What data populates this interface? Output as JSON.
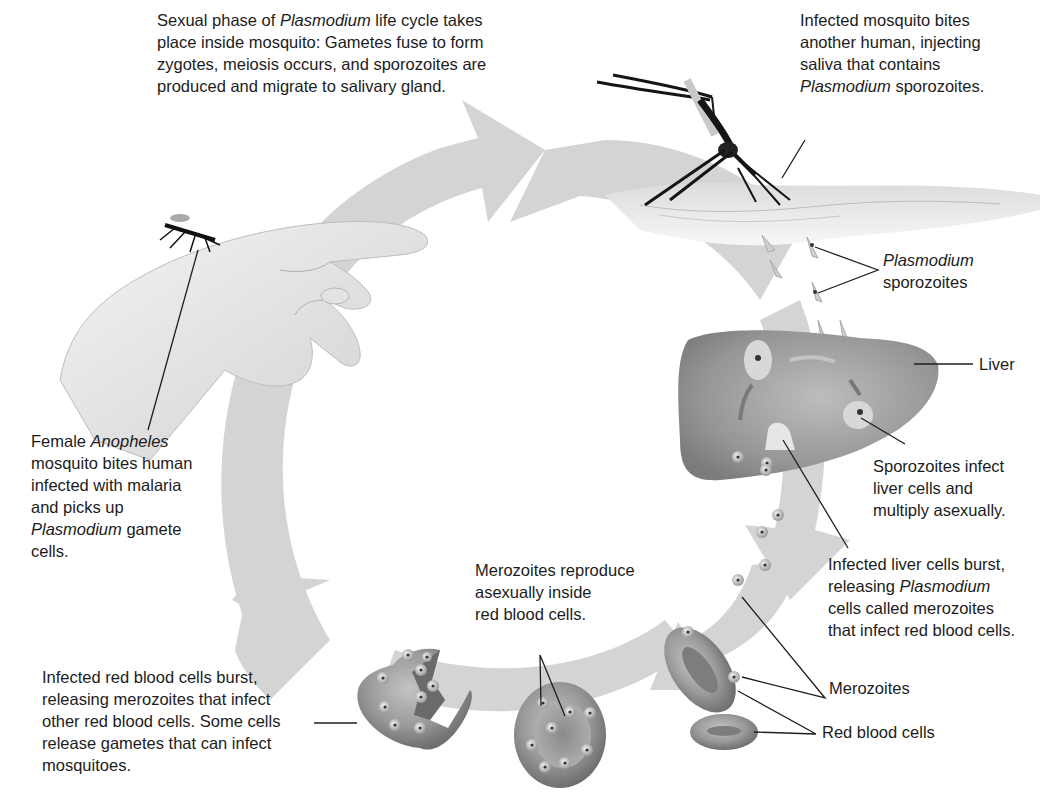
{
  "diagram": {
    "colors": {
      "ring": "#d4d4d4",
      "rbc_fill": "#a9a9a9",
      "rbc_dark": "#7a7a7a",
      "liver_fill": "#9e9e9e",
      "skin": "#e6e6e6",
      "leader_line": "#1e1e1e",
      "text": "#1c1c1c"
    },
    "labels": {
      "sexual_phase": {
        "parts": [
          "Sexual phase of ",
          "Plasmodium",
          " life cycle takes place inside mosquito: Gametes fuse to form zygotes, meiosis occurs, and sporozoites are produced and migrate to salivary gland."
        ],
        "lines": [
          [
            "Sexual phase of ",
            "Plasmodium",
            " life cycle takes"
          ],
          [
            "place inside mosquito: Gametes fuse to form"
          ],
          [
            "zygotes, meiosis occurs, and sporozoites are"
          ],
          [
            "produced and migrate to salivary gland."
          ]
        ]
      },
      "mosquito_bites_another": {
        "lines": [
          [
            "Infected mosquito bites"
          ],
          [
            "another human, injecting"
          ],
          [
            "saliva that contains"
          ],
          [
            "",
            "Plasmodium",
            " sporozoites."
          ]
        ]
      },
      "plasmodium_sporozoites": {
        "lines": [
          [
            "",
            "Plasmodium",
            ""
          ],
          [
            "sporozoites"
          ]
        ]
      },
      "liver": {
        "text": "Liver"
      },
      "sporozoites_infect_liver": {
        "lines": [
          [
            "Sporozoites infect"
          ],
          [
            "liver cells and"
          ],
          [
            "multiply asexually."
          ]
        ]
      },
      "liver_cells_burst": {
        "lines": [
          [
            "Infected liver cells burst,"
          ],
          [
            "releasing ",
            "Plasmodium",
            ""
          ],
          [
            "cells called merozoites"
          ],
          [
            "that infect red blood cells."
          ]
        ]
      },
      "merozoites": {
        "text": "Merozoites"
      },
      "red_blood_cells": {
        "text": "Red blood cells"
      },
      "merozoites_reproduce": {
        "lines": [
          [
            "Merozoites reproduce"
          ],
          [
            "asexually inside"
          ],
          [
            "red blood cells."
          ]
        ]
      },
      "rbc_burst": {
        "lines": [
          [
            "Infected red blood cells burst,"
          ],
          [
            "releasing merozoites that infect"
          ],
          [
            "other red blood cells. Some cells"
          ],
          [
            "release gametes that can infect"
          ],
          [
            "mosquitoes."
          ]
        ]
      },
      "female_anopheles": {
        "lines": [
          [
            "Female ",
            "Anopheles",
            ""
          ],
          [
            "mosquito bites human"
          ],
          [
            "infected with malaria"
          ],
          [
            "and picks up"
          ],
          [
            "",
            "Plasmodium",
            " gamete"
          ],
          [
            "cells."
          ]
        ]
      }
    },
    "icons": [
      "hand-illustration",
      "mosquito-illustration",
      "skin-illustration",
      "liver-illustration",
      "red-blood-cell-illustration",
      "cycle-arrow"
    ]
  }
}
